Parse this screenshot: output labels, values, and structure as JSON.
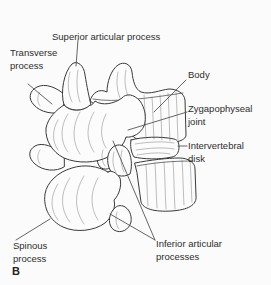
{
  "figure": {
    "type": "anatomical-line-drawing",
    "panel_letter": "B",
    "ink_color": "#3a3a3a",
    "background_color": "#fbfbfb",
    "labels": {
      "superior_articular_process": "Superior articular process",
      "transverse_process": "Transverse\nprocess",
      "body": "Body",
      "zygapophyseal_joint": "Zygapophyseal\njoint",
      "intervertebral_disk": "Intervertebral\ndisk",
      "inferior_articular_processes": "Inferior articular\nprocesses",
      "spinous_process": "Spinous\nprocess"
    }
  }
}
